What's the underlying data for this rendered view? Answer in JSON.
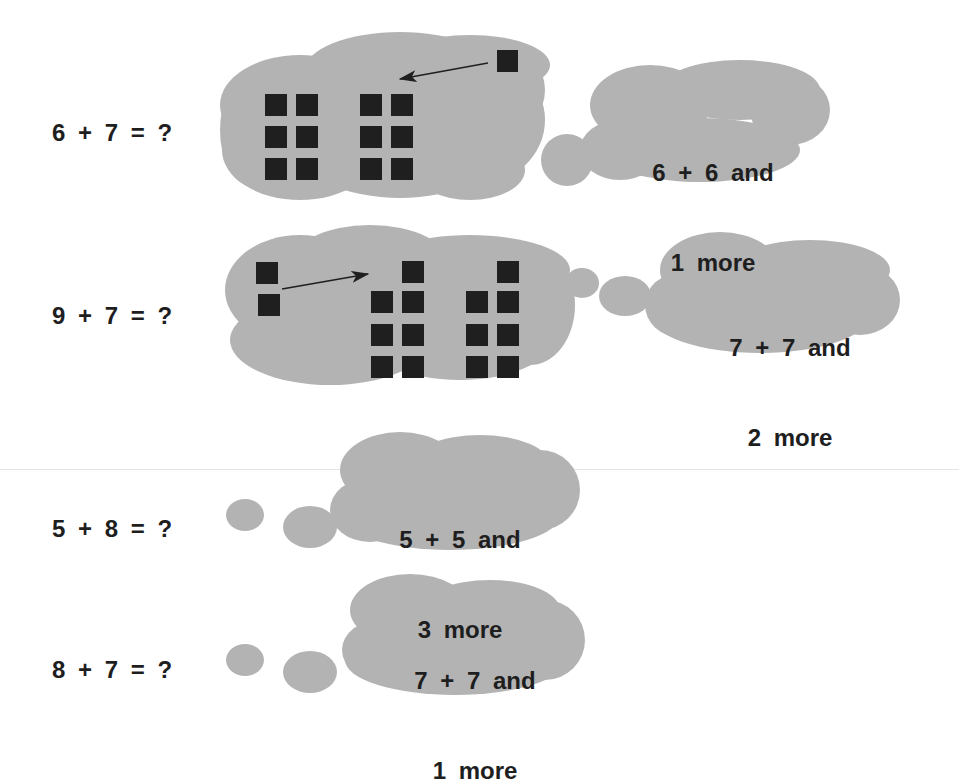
{
  "colors": {
    "cloud_fill": "#b3b3b3",
    "block_fill": "#1f1f1f",
    "text": "#1e1e1e"
  },
  "problems": [
    {
      "equation": "6 + 7 = ?",
      "blocks_cloud": {
        "groups": [
          {
            "columns": 2,
            "rows": 3,
            "count": 6
          },
          {
            "columns": 2,
            "rows": 3,
            "count": 6
          }
        ],
        "moving_block_count": 1,
        "arrow": "right-to-left"
      },
      "strategy_line1": "6 + 6 and",
      "strategy_line2": "1 more"
    },
    {
      "equation": "9 + 7 = ?",
      "blocks_cloud": {
        "groups": [
          {
            "columns": 2,
            "rows": 4,
            "count": 7
          },
          {
            "columns": 2,
            "rows": 4,
            "count": 7
          }
        ],
        "moving_block_count": 2,
        "arrow": "left-to-right"
      },
      "strategy_line1": "7 + 7 and",
      "strategy_line2": "2 more"
    },
    {
      "equation": "5 + 8 = ?",
      "strategy_line1": "5 + 5 and",
      "strategy_line2": "3 more"
    },
    {
      "equation": "8 + 7 = ?",
      "strategy_line1": "7 + 7 and",
      "strategy_line2": "1 more"
    }
  ]
}
